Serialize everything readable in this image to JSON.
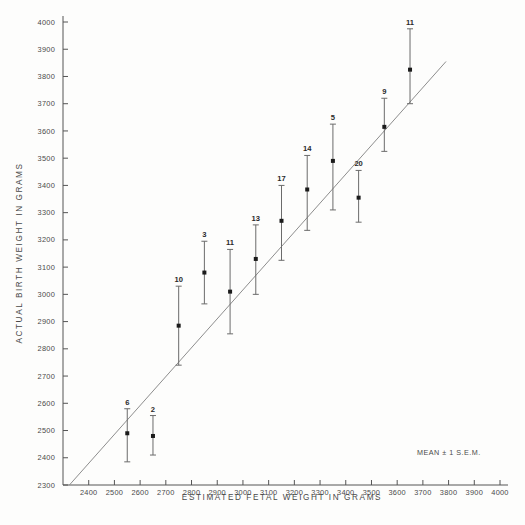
{
  "chart_data": {
    "type": "scatter",
    "title": "",
    "xlabel": "ESTIMATED  FETAL  WEIGHT  IN  GRAMS",
    "ylabel": "ACTUAL  BIRTH  WEIGHT  IN  GRAMS",
    "xlim": [
      2300,
      4000
    ],
    "ylim": [
      2300,
      4000
    ],
    "xticks": [
      2400,
      2500,
      2600,
      2700,
      2800,
      2900,
      3000,
      3100,
      3200,
      3300,
      3400,
      3500,
      3600,
      3700,
      3800,
      3900,
      4000
    ],
    "yticks": [
      2300,
      2400,
      2500,
      2600,
      2700,
      2800,
      2900,
      3000,
      3100,
      3200,
      3300,
      3400,
      3500,
      3600,
      3700,
      3800,
      3900,
      4000
    ],
    "grid": false,
    "legend": "MEAN ± 1 S.E.M.",
    "annotation": "MEAN ± 1 S.E.M.",
    "reference_line": {
      "label": "line of identity",
      "x": [
        2325,
        3790
      ],
      "y": [
        2300,
        3855
      ]
    },
    "error_bar_type": "mean ± 1 S.E.M.",
    "point_label_meaning": "n (number of cases)",
    "points": [
      {
        "n": 6,
        "x": 2550,
        "y": 2490,
        "low": 2385,
        "high": 2580
      },
      {
        "n": 2,
        "x": 2650,
        "y": 2480,
        "low": 2410,
        "high": 2555
      },
      {
        "n": 10,
        "x": 2750,
        "y": 2885,
        "low": 2740,
        "high": 3030
      },
      {
        "n": 3,
        "x": 2850,
        "y": 3080,
        "low": 2965,
        "high": 3195
      },
      {
        "n": 11,
        "x": 2950,
        "y": 3010,
        "low": 2855,
        "high": 3165
      },
      {
        "n": 13,
        "x": 3050,
        "y": 3130,
        "low": 3000,
        "high": 3255
      },
      {
        "n": 17,
        "x": 3150,
        "y": 3270,
        "low": 3125,
        "high": 3400
      },
      {
        "n": 14,
        "x": 3250,
        "y": 3385,
        "low": 3235,
        "high": 3510
      },
      {
        "n": 5,
        "x": 3350,
        "y": 3490,
        "low": 3310,
        "high": 3625
      },
      {
        "n": 20,
        "x": 3450,
        "y": 3355,
        "low": 3265,
        "high": 3455
      },
      {
        "n": 9,
        "x": 3550,
        "y": 3615,
        "low": 3525,
        "high": 3720
      },
      {
        "n": 11,
        "x": 3650,
        "y": 3825,
        "low": 3700,
        "high": 3975
      }
    ]
  },
  "axes": {
    "x_title": "ESTIMATED  FETAL  WEIGHT  IN  GRAMS",
    "y_title": "ACTUAL  BIRTH  WEIGHT  IN  GRAMS"
  },
  "annotations": {
    "sem_note": "MEAN ± 1 S.E.M."
  },
  "colors": {
    "axis": "#555555",
    "marker": "#1b1b1b",
    "errorbar": "#6b6b6b",
    "reference_line": "#8d8d8d",
    "background": "#fdfdfc",
    "text": "#4a4a4a"
  }
}
